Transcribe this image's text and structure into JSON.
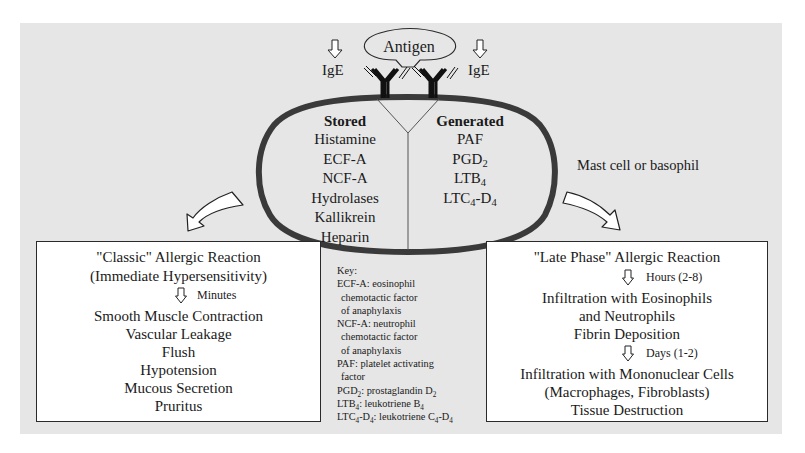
{
  "diagram": {
    "antigen_label": "Antigen",
    "ige_left_label": "IgE",
    "ige_right_label": "IgE",
    "cell_label": "Mast cell or basophil",
    "stored": {
      "heading": "Stored",
      "items": [
        "Histamine",
        "ECF-A",
        "NCF-A",
        "Hydrolases",
        "Kallikrein",
        "Heparin"
      ]
    },
    "generated": {
      "heading": "Generated",
      "items": [
        {
          "base": "PAF",
          "sub": "",
          "rest": "",
          "sub2": ""
        },
        {
          "base": "PGD",
          "sub": "2",
          "rest": "",
          "sub2": ""
        },
        {
          "base": "LTB",
          "sub": "4",
          "rest": "",
          "sub2": ""
        },
        {
          "base": "LTC",
          "sub": "4",
          "rest": "-D",
          "sub2": "4"
        }
      ]
    },
    "classic": {
      "title_line1": "\"Classic\" Allergic Reaction",
      "title_line2": "(Immediate Hypersensitivity)",
      "time_label": "Minutes",
      "effects": [
        "Smooth Muscle Contraction",
        "Vascular Leakage",
        "Flush",
        "Hypotension",
        "Mucous Secretion",
        "Pruritus"
      ]
    },
    "late": {
      "title": "\"Late Phase\" Allergic Reaction",
      "step1_label": "Hours (2-8)",
      "step1_effects": [
        "Infiltration with Eosinophils",
        "and Neutrophils",
        "Fibrin Deposition"
      ],
      "step2_label": "Days (1-2)",
      "step2_effects": [
        "Infiltration with Mononuclear Cells",
        "(Macrophages, Fibroblasts)",
        "Tissue Destruction"
      ]
    },
    "key": {
      "heading": "Key:",
      "ecf_a": "ECF-A: eosinophil",
      "ecf_a_2": "chemotactic factor",
      "ecf_a_3": "of anaphylaxis",
      "ncf_a": "NCF-A: neutrophil",
      "ncf_a_2": "chemotactic factor",
      "ncf_a_3": "of anaphylaxis",
      "paf": "PAF: platelet activating",
      "paf_2": "factor",
      "pgd2_a": "PGD",
      "pgd2_sub": "2",
      "pgd2_b": ": prostaglandin D",
      "pgd2_sub2": "2",
      "ltb4_a": "LTB",
      "ltb4_sub": "4",
      "ltb4_b": ": leukotriene B",
      "ltb4_sub2": "4",
      "ltc4_a": "LTC",
      "ltc4_sub": "4",
      "ltc4_b": "-D",
      "ltc4_sub2": "4",
      "ltc4_c": ": leukotriene C",
      "ltc4_sub3": "4",
      "ltc4_d": "-D",
      "ltc4_sub4": "4"
    },
    "colors": {
      "panel_bg": "#e6e6e6",
      "cell_outline": "#3a3a3a",
      "box_bg": "#ffffff",
      "arrow_fill": "#ffffff"
    }
  }
}
